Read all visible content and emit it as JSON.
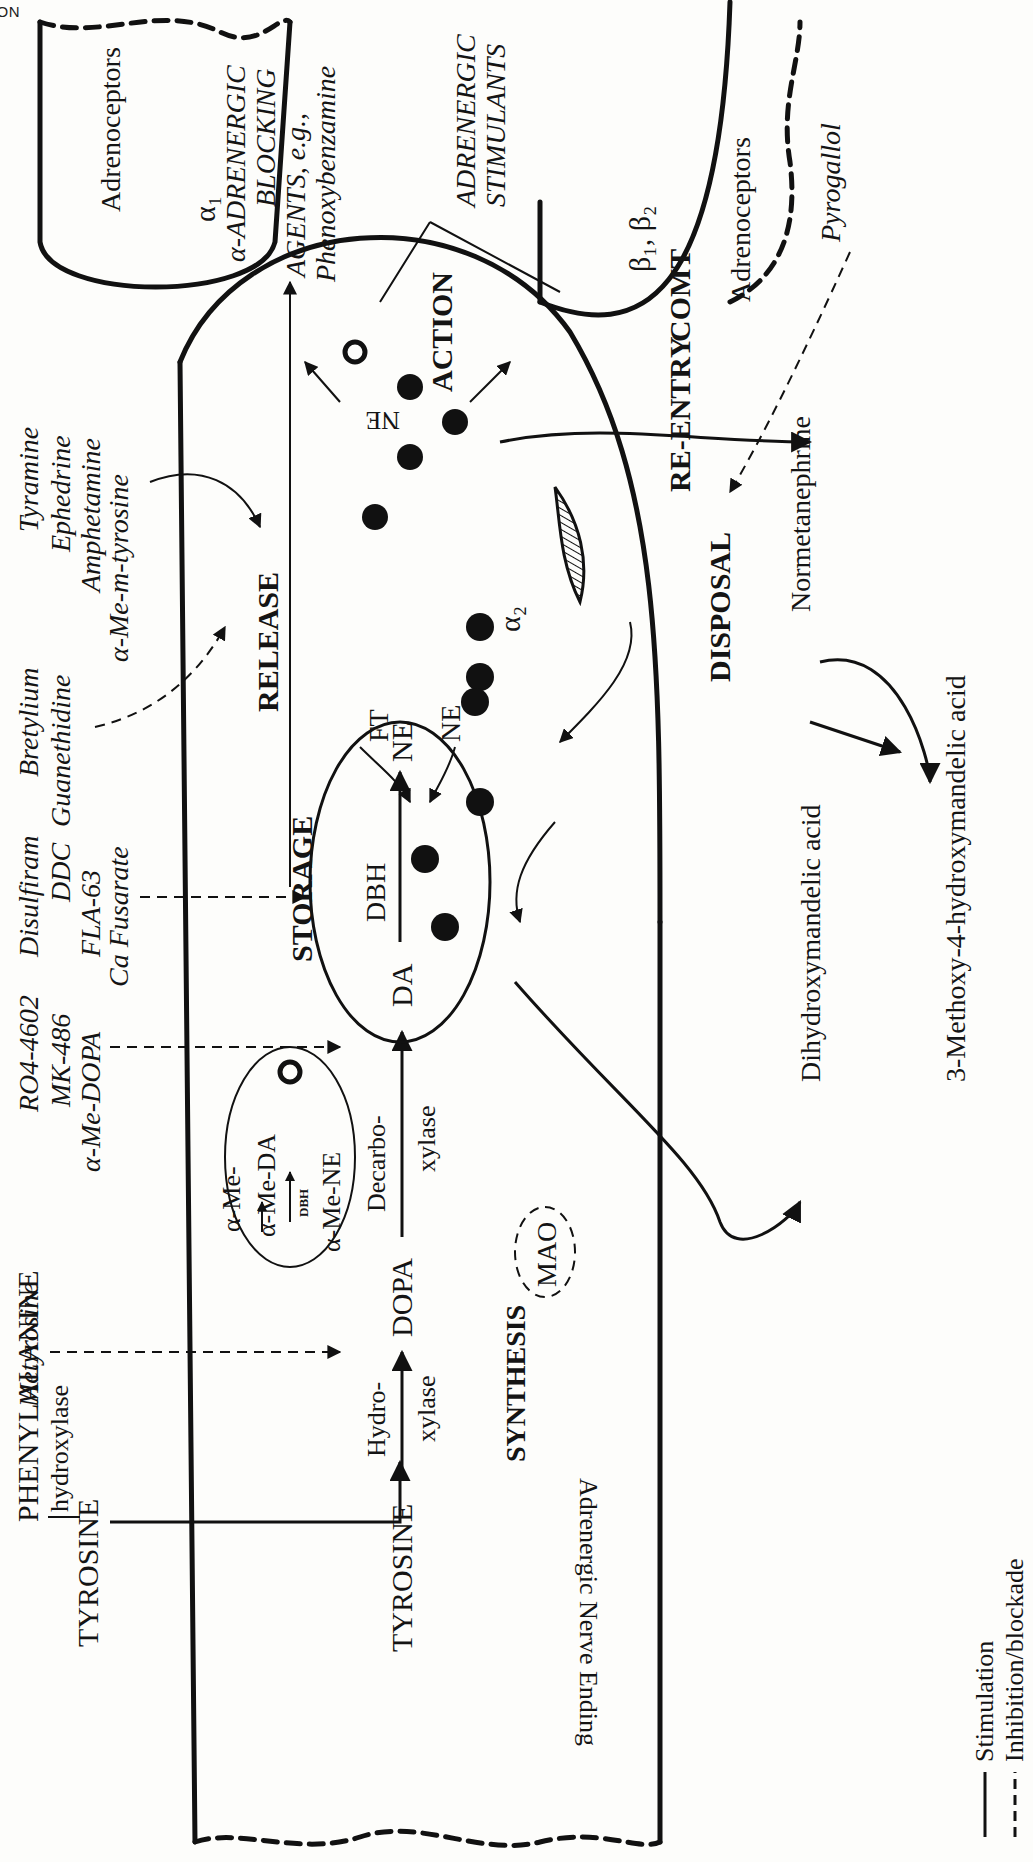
{
  "header": {
    "running_title": "ADRENERGIC TRANSMISSION"
  },
  "sections": {
    "synthesis": "SYNTHESIS",
    "storage": "STORAGE",
    "release": "RELEASE",
    "action": "ACTION",
    "reentry": "RE-ENTRY",
    "disposal": "DISPOSAL"
  },
  "precursors": {
    "phenylalanine": "PHENYLALANINE",
    "hydroxylase": "hydroxylase",
    "tyrosine_top": "TYROSINE",
    "tyrosine": "TYROSINE",
    "hydro_enzyme": [
      "Hydro-",
      "xylase"
    ],
    "dopa": "DOPA",
    "decarbo_enzyme": [
      "Decarbo-",
      "xylase"
    ]
  },
  "vesicles": {
    "main": {
      "da": "DA",
      "dbh": "DBH",
      "ne": "NE"
    },
    "false": {
      "alpha_me_da": "α-Me-DA",
      "dbh": "DBH",
      "alpha_me_ne": "α-Me-NE",
      "alpha_me": "α-Me-"
    },
    "ft": "FT",
    "ne_uptake": "NE"
  },
  "nerve_ending": {
    "label": "Adrenergic Nerve Ending",
    "alpha2": "α₂",
    "mao": "MAO"
  },
  "synapse": {
    "ne": "NE"
  },
  "receptors": {
    "alpha": {
      "label": "Adrenoceptors",
      "subtype": "α₁"
    },
    "beta": {
      "label": "Adrenoceptors",
      "subtype": "β₁, β₂"
    }
  },
  "metabolism": {
    "comt": "COMT",
    "normetanephrine": "Normetanephrine",
    "dihydroxymandelic": "Dihydroxymandelic acid",
    "vma": "3-Methoxy-4-hydroxymandelic acid"
  },
  "drugs": {
    "metyrosine": [
      "Metyrosine"
    ],
    "decarboxylase_inhibitors": [
      "RO4-4602",
      "MK-486",
      "α-Me-DOPA"
    ],
    "dbh_inhibitors": [
      "Disulfiram",
      "DDC",
      "FLA-63",
      "Ca Fusarate"
    ],
    "release_blockers": [
      "Bretylium",
      "Guanethidine"
    ],
    "releasers": [
      "Tyramine",
      "Ephedrine",
      "Amphetamine",
      "α-Me-m-tyrosine"
    ],
    "alpha_blockers": [
      "α-ADRENERGIC",
      "BLOCKING",
      "AGENTS, e.g.,",
      "Phenoxybenzamine"
    ],
    "stimulants": [
      "ADRENERGIC",
      "STIMULANTS"
    ],
    "beta_blockers": [
      "β-ADRENERGIC",
      "BLOCKING",
      "AGENTS, e.g.,",
      "Propranolol"
    ],
    "comt_inhibitor": [
      "Pyrogallol"
    ],
    "alpha2_agonist": [
      "Clonidine"
    ],
    "alpha2_antagonists": [
      "Rauwolscine",
      "Yohimbine"
    ],
    "uptake_blockers": [
      "Cocaine",
      "Imipramine",
      "Ouabain"
    ],
    "vesicle_blockers": [
      "Reserpine",
      "Tetrabenazine"
    ],
    "mao_inhibitors": [
      "MAO INHIBITORS,",
      "e.g. Iproniazid",
      "Tranylcypromine",
      "Phenelzine",
      "Isocarboxazid"
    ]
  },
  "legend": {
    "items": [
      {
        "style": "solid",
        "label": "Stimulation"
      },
      {
        "style": "dashed",
        "label": "Inhibition/blockade"
      }
    ]
  }
}
